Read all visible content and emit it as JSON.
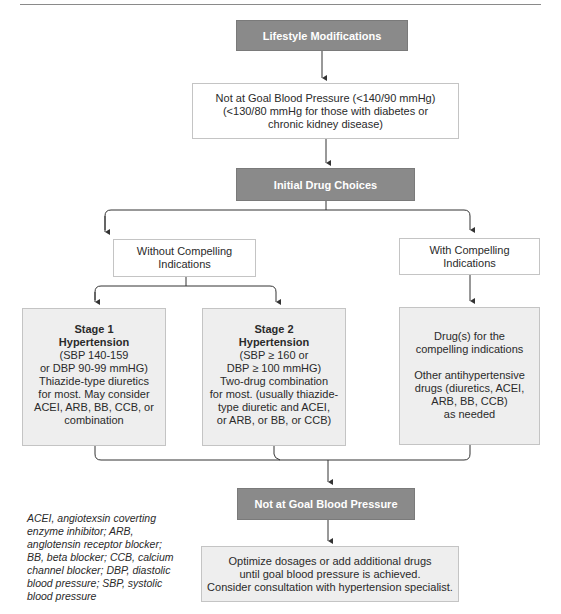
{
  "diagram": {
    "nodes": {
      "lifestyle": {
        "label": "Lifestyle Modifications"
      },
      "not_at_goal_initial": {
        "lines": [
          "Not at Goal Blood Pressure (<140/90 mmHg)",
          "(<130/80 mmHg for those with diabetes or",
          "chronic kidney disease)"
        ]
      },
      "initial_drug": {
        "label": "Initial Drug Choices"
      },
      "without_compelling": {
        "lines": [
          "Without Compelling",
          "Indications"
        ]
      },
      "with_compelling": {
        "lines": [
          "With Compelling",
          "Indications"
        ]
      },
      "stage1": {
        "title_lines": [
          "Stage 1",
          "Hypertension"
        ],
        "lines": [
          "(SBP 140-159",
          "or DBP 90-99 mmHG)",
          "Thiazide-type diuretics",
          "for most. May consider",
          "ACEI, ARB, BB, CCB, or",
          "combination"
        ]
      },
      "stage2": {
        "title_lines": [
          "Stage 2",
          "Hypertension"
        ],
        "lines": [
          "(SBP ≥ 160 or",
          "DBP ≥ 100 mmHG)",
          "Two-drug combination",
          "for most. (usually thiazide-",
          "type diuretic and ACEI,",
          "or ARB,  or BB, or CCB)"
        ]
      },
      "compelling_drugs": {
        "lines_a": [
          "Drug(s) for the",
          "compelling indications"
        ],
        "lines_b": [
          "Other antihypertensive",
          "drugs (diuretics, ACEI,",
          "ARB, BB, CCB)",
          "as needed"
        ]
      },
      "not_at_goal_final": {
        "label": "Not at Goal Blood Pressure"
      },
      "optimize": {
        "lines": [
          "Optimize dosages or add additional drugs",
          "until goal blood pressure is achieved.",
          "Consider consultation with hypertension specialist."
        ]
      }
    },
    "legend": {
      "lines": [
        "ACEI, angiotexsin coverting",
        "enzyme inhibitor; ARB,",
        "anglotensin receptor blocker;",
        "BB, beta blocker; CCB, calcium",
        "channel blocker; DBP, diastolic",
        "blood pressure; SBP, systolic",
        "blood pressure"
      ]
    },
    "colors": {
      "dark_box": "#8a8a8a",
      "grey_box": "#eeeeee",
      "border": "#c4c4c4",
      "connector": "#333333"
    }
  }
}
